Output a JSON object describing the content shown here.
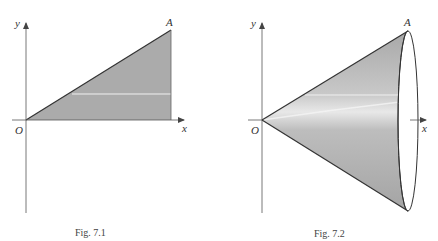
{
  "figures": [
    {
      "caption": "Fig. 7.1",
      "labels": {
        "y_axis": "y",
        "x_axis": "x",
        "origin": "O",
        "point": "A"
      },
      "shape": "right triangle region under line OA",
      "fill_color": "#a9a9a9"
    },
    {
      "caption": "Fig. 7.2",
      "labels": {
        "y_axis": "y",
        "x_axis": "x",
        "origin": "O",
        "point": "A"
      },
      "shape": "cone of revolution about x-axis with elliptical base",
      "fill_color": "#b0b0b0"
    }
  ],
  "colors": {
    "axis": "#555555",
    "edge": "#333333",
    "highlight": "#f2f2f2"
  }
}
